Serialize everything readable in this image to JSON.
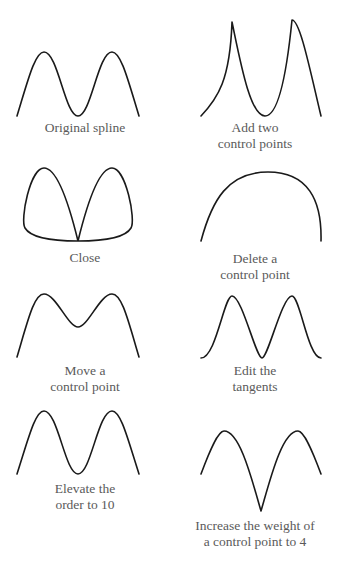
{
  "panels": [
    {
      "id": "original",
      "caption_line1": "Original spline",
      "caption_line2": ""
    },
    {
      "id": "add",
      "caption_line1": "Add two",
      "caption_line2": "control points"
    },
    {
      "id": "close",
      "caption_line1": "Close",
      "caption_line2": ""
    },
    {
      "id": "delete",
      "caption_line1": "Delete a",
      "caption_line2": "control point"
    },
    {
      "id": "move",
      "caption_line1": "Move a",
      "caption_line2": "control point"
    },
    {
      "id": "tangents",
      "caption_line1": "Edit the",
      "caption_line2": "tangents"
    },
    {
      "id": "elevate",
      "caption_line1": "Elevate the",
      "caption_line2": "order to 10"
    },
    {
      "id": "weight",
      "caption_line1": "Increase the weight of",
      "caption_line2": "a control point to 4"
    }
  ]
}
